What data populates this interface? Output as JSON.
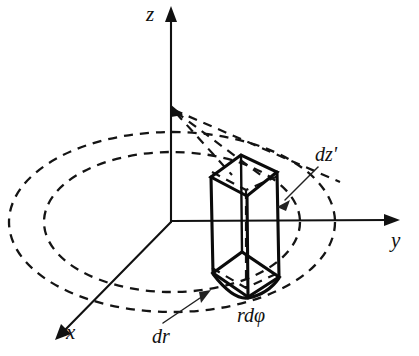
{
  "figure": {
    "background_color": "#ffffff",
    "ink_color": "#111111",
    "width": 419,
    "height": 356
  },
  "axes": [
    {
      "id": "z",
      "label": "z",
      "direction": "up",
      "origin": [
        172,
        222
      ],
      "tip": [
        170,
        10
      ]
    },
    {
      "id": "y",
      "label": "y",
      "direction": "right",
      "origin": [
        172,
        222
      ],
      "tip": [
        398,
        220
      ]
    },
    {
      "id": "x",
      "label": "x",
      "direction": "down-left",
      "origin": [
        172,
        222
      ],
      "tip": [
        56,
        339
      ]
    }
  ],
  "rings": [
    {
      "id": "outer-ring",
      "style": "dashed",
      "cx": 172,
      "cy": 222,
      "rx": 163,
      "ry": 90
    },
    {
      "id": "inner-ring",
      "style": "dashed",
      "cx": 172,
      "cy": 222,
      "rx": 128,
      "ry": 70
    }
  ],
  "volume_element": {
    "id": "prism",
    "style": "solid",
    "description": "curvilinear box spanning dr, r dphi and dz'"
  },
  "annotations": [
    {
      "id": "dz-prime",
      "label": "dz'",
      "leader_from": [
        316,
        168
      ],
      "leader_to": [
        279,
        204
      ]
    },
    {
      "id": "dr",
      "label": "dr",
      "leader_from": [
        163,
        324
      ],
      "leader_to": [
        209,
        291
      ]
    },
    {
      "id": "rdphi",
      "label": "rdφ",
      "leader_from": null,
      "leader_to": null
    }
  ]
}
